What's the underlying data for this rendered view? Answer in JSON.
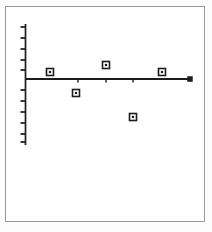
{
  "figure": {
    "title": "",
    "background_color": "#ffffff",
    "frame_color": "#9a9a9a",
    "ink_color": "#1c1c1c",
    "frame": {
      "x": 5,
      "y": 6,
      "width": 200,
      "height": 216
    }
  },
  "chart_data": {
    "type": "scatter",
    "title": "",
    "xlabel": "",
    "ylabel": "",
    "grid": false,
    "legend": null,
    "xlim": [
      0,
      212
    ],
    "ylim": [
      0,
      232
    ],
    "axes": {
      "y_axis": {
        "x": 25,
        "y_top": 24,
        "y_bottom": 145,
        "label": ""
      },
      "x_axis": {
        "y": 79,
        "x_left": 25,
        "x_right": 190,
        "label": ""
      }
    },
    "y_ticks": [
      {
        "position": 27,
        "label": ""
      },
      {
        "position": 38,
        "label": ""
      },
      {
        "position": 49,
        "label": ""
      },
      {
        "position": 60,
        "label": ""
      },
      {
        "position": 70,
        "label": ""
      },
      {
        "position": 90,
        "label": ""
      },
      {
        "position": 101,
        "label": ""
      },
      {
        "position": 112,
        "label": ""
      },
      {
        "position": 123,
        "label": ""
      },
      {
        "position": 134,
        "label": ""
      },
      {
        "position": 142,
        "label": ""
      }
    ],
    "x_ticks": [
      {
        "position": 78,
        "label": ""
      },
      {
        "position": 106,
        "label": ""
      },
      {
        "position": 133,
        "label": ""
      }
    ],
    "points": [
      {
        "x": 50,
        "y": 72,
        "marker": "open-square"
      },
      {
        "x": 76,
        "y": 93,
        "marker": "open-square"
      },
      {
        "x": 106,
        "y": 65,
        "marker": "open-square"
      },
      {
        "x": 133,
        "y": 117,
        "marker": "open-square"
      },
      {
        "x": 162,
        "y": 72,
        "marker": "open-square"
      }
    ],
    "endpoint_marker": {
      "x": 190,
      "y": 79,
      "marker": "filled-square"
    }
  }
}
